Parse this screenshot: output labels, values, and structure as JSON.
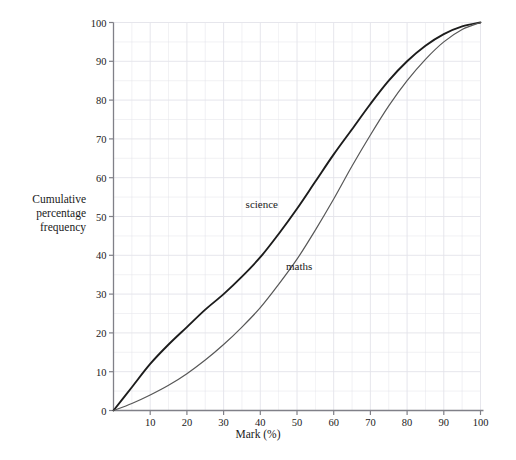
{
  "chart_data": {
    "type": "line",
    "title": "",
    "subtitle": "",
    "xlabel": "Mark (%)",
    "ylabel": "Cumulative\npercentage\nfrequency",
    "xlim": [
      0,
      100
    ],
    "ylim": [
      0,
      100
    ],
    "xticks": [
      0,
      10,
      20,
      30,
      40,
      50,
      60,
      70,
      80,
      90,
      100
    ],
    "xtick_labels": [
      "",
      "10",
      "20",
      "30",
      "40",
      "50",
      "60",
      "70",
      "80",
      "90",
      "100"
    ],
    "yticks": [
      0,
      10,
      20,
      30,
      40,
      50,
      60,
      70,
      80,
      90,
      100
    ],
    "ytick_labels": [
      "0",
      "10",
      "20",
      "30",
      "40",
      "50",
      "60",
      "70",
      "80",
      "90",
      "100"
    ],
    "grid": true,
    "grid_minor_step": 5,
    "grid_color": "#e3e3ea",
    "legend_position": "inline-annotation",
    "series": [
      {
        "name": "science",
        "color": "#1c1c1c",
        "width": 1.9,
        "annotation": {
          "text": "science",
          "x": 36,
          "y": 53
        },
        "x": [
          0,
          5,
          10,
          15,
          20,
          25,
          30,
          35,
          40,
          45,
          50,
          55,
          60,
          65,
          70,
          75,
          80,
          85,
          90,
          95,
          100
        ],
        "values": [
          0,
          6,
          12,
          17,
          21.5,
          26,
          30,
          34.5,
          39.5,
          45.5,
          52,
          59,
          66,
          72.5,
          79,
          85,
          90,
          94,
          97,
          99,
          100
        ]
      },
      {
        "name": "maths",
        "color": "#575757",
        "width": 1.2,
        "annotation": {
          "text": "maths",
          "x": 47,
          "y": 37
        },
        "x": [
          0,
          5,
          10,
          15,
          20,
          25,
          30,
          35,
          40,
          45,
          50,
          55,
          60,
          65,
          70,
          75,
          80,
          85,
          90,
          95,
          100
        ],
        "values": [
          0,
          1.8,
          4,
          6.5,
          9.5,
          13,
          17,
          21.5,
          26.5,
          32.5,
          39,
          46.5,
          54.5,
          63,
          71,
          78.5,
          85,
          90.5,
          95,
          98.2,
          100
        ]
      }
    ]
  },
  "axes": {
    "x_label": "Mark (%)",
    "y_label_lines": [
      "Cumulative",
      "percentage",
      "frequency"
    ]
  },
  "annotations": {
    "science": "science",
    "maths": "maths"
  }
}
